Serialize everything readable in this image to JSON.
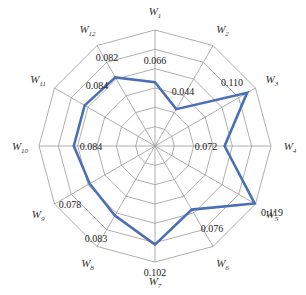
{
  "chart_data": {
    "type": "radar",
    "title": "",
    "categories": [
      "W1",
      "W2",
      "W3",
      "W4",
      "W5",
      "W6",
      "W7",
      "W8",
      "W9",
      "W10",
      "W11",
      "W12"
    ],
    "axis_labels": [
      {
        "base": "W",
        "sub": "1"
      },
      {
        "base": "W",
        "sub": "2"
      },
      {
        "base": "W",
        "sub": "3"
      },
      {
        "base": "W",
        "sub": "4"
      },
      {
        "base": "W",
        "sub": "5"
      },
      {
        "base": "W",
        "sub": "6"
      },
      {
        "base": "W",
        "sub": "7"
      },
      {
        "base": "W",
        "sub": "8"
      },
      {
        "base": "W",
        "sub": "9"
      },
      {
        "base": "W",
        "sub": "10"
      },
      {
        "base": "W",
        "sub": "11"
      },
      {
        "base": "W",
        "sub": "12"
      }
    ],
    "series": [
      {
        "name": "weights",
        "color": "#4a6fb5",
        "values": [
          0.066,
          0.044,
          0.11,
          0.072,
          0.119,
          0.076,
          0.102,
          0.083,
          0.078,
          0.084,
          0.084,
          0.082
        ],
        "value_labels": [
          "0.066",
          "0.044",
          "0.110",
          "0.072",
          "0.119",
          "0.076",
          "0.102",
          "0.083",
          "0.078",
          "0.084",
          "0.084",
          "0.082"
        ]
      }
    ],
    "rlim": [
      0,
      0.12
    ],
    "ring_count": 6,
    "grid": true,
    "legend": "none"
  }
}
